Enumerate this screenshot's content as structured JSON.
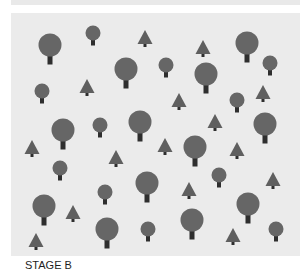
{
  "caption": {
    "label": "STAGE B"
  },
  "colors": {
    "background": "#ebebeb",
    "canopy": "#666666",
    "trunk": "#2e2e2e",
    "pine": "#5f5f5f"
  },
  "trees": [
    {
      "type": "round",
      "size": "big",
      "x": 50,
      "y": 45
    },
    {
      "type": "round",
      "size": "small",
      "x": 93,
      "y": 33
    },
    {
      "type": "pine",
      "x": 145,
      "y": 38
    },
    {
      "type": "pine",
      "x": 203,
      "y": 48
    },
    {
      "type": "round",
      "size": "big",
      "x": 247,
      "y": 43
    },
    {
      "type": "round",
      "size": "small",
      "x": 270,
      "y": 63
    },
    {
      "type": "round",
      "size": "big",
      "x": 126,
      "y": 69
    },
    {
      "type": "round",
      "size": "small",
      "x": 166,
      "y": 65
    },
    {
      "type": "round",
      "size": "big",
      "x": 206,
      "y": 74
    },
    {
      "type": "pine",
      "x": 87,
      "y": 87
    },
    {
      "type": "round",
      "size": "small",
      "x": 42,
      "y": 91
    },
    {
      "type": "pine",
      "x": 179,
      "y": 101
    },
    {
      "type": "round",
      "size": "small",
      "x": 237,
      "y": 100
    },
    {
      "type": "pine",
      "x": 263,
      "y": 93
    },
    {
      "type": "round",
      "size": "big",
      "x": 63,
      "y": 130
    },
    {
      "type": "round",
      "size": "small",
      "x": 100,
      "y": 125
    },
    {
      "type": "round",
      "size": "big",
      "x": 140,
      "y": 122
    },
    {
      "type": "pine",
      "x": 32,
      "y": 148
    },
    {
      "type": "pine",
      "x": 116,
      "y": 158
    },
    {
      "type": "pine",
      "x": 215,
      "y": 122
    },
    {
      "type": "round",
      "size": "big",
      "x": 265,
      "y": 124
    },
    {
      "type": "pine",
      "x": 165,
      "y": 146
    },
    {
      "type": "round",
      "size": "big",
      "x": 195,
      "y": 147
    },
    {
      "type": "pine",
      "x": 237,
      "y": 150
    },
    {
      "type": "round",
      "size": "small",
      "x": 60,
      "y": 168
    },
    {
      "type": "round",
      "size": "big",
      "x": 147,
      "y": 183
    },
    {
      "type": "round",
      "size": "small",
      "x": 105,
      "y": 192
    },
    {
      "type": "round",
      "size": "big",
      "x": 44,
      "y": 206
    },
    {
      "type": "pine",
      "x": 73,
      "y": 213
    },
    {
      "type": "round",
      "size": "big",
      "x": 107,
      "y": 229
    },
    {
      "type": "round",
      "size": "small",
      "x": 148,
      "y": 229
    },
    {
      "type": "pine",
      "x": 36,
      "y": 241
    },
    {
      "type": "round",
      "size": "small",
      "x": 219,
      "y": 175
    },
    {
      "type": "pine",
      "x": 189,
      "y": 190
    },
    {
      "type": "pine",
      "x": 273,
      "y": 180
    },
    {
      "type": "round",
      "size": "big",
      "x": 248,
      "y": 204
    },
    {
      "type": "round",
      "size": "big",
      "x": 192,
      "y": 220
    },
    {
      "type": "pine",
      "x": 233,
      "y": 236
    },
    {
      "type": "round",
      "size": "small",
      "x": 276,
      "y": 229
    }
  ]
}
